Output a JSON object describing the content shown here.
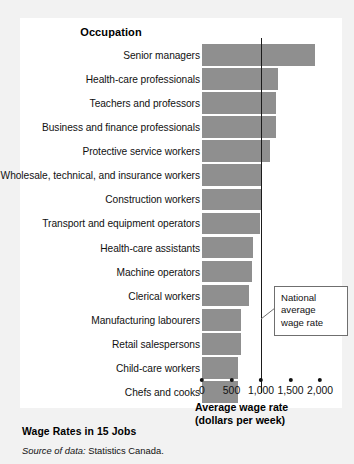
{
  "figure": {
    "column_heading": "Occupation",
    "title": "Wage Rates in 15 Jobs",
    "source_label": "Source of data:",
    "source_value": "Statistics Canada.",
    "callout": "National average wage rate",
    "bar_color": "#8f8f8f",
    "line_color": "#1b1b1b",
    "panel_color": "#ffffff",
    "background_color": "#f2f2f2"
  },
  "chart_data": {
    "type": "bar",
    "orientation": "horizontal",
    "title": "Wage Rates in 15 Jobs",
    "xlabel": "Average wage rate (dollars per week)",
    "ylabel": "Occupation",
    "xlim": [
      0,
      2000
    ],
    "xticks": [
      0,
      500,
      1000,
      1500,
      2000
    ],
    "xtick_labels": [
      "0",
      "500",
      "1,000",
      "1,500",
      "2,000"
    ],
    "grid": false,
    "legend": null,
    "annotations": [
      {
        "text": "National average wage rate",
        "type": "reference-line",
        "value": 1000
      }
    ],
    "categories": [
      "Senior managers",
      "Health-care professionals",
      "Teachers and professors",
      "Business and finance professionals",
      "Protective service workers",
      "Wholesale, technical, and insurance workers",
      "Construction workers",
      "Transport and equipment operators",
      "Health-care assistants",
      "Machine operators",
      "Clerical workers",
      "Manufacturing labourers",
      "Retail salespersons",
      "Child-care workers",
      "Chefs and cooks"
    ],
    "values": [
      1920,
      1280,
      1250,
      1250,
      1150,
      1010,
      1000,
      990,
      870,
      850,
      800,
      660,
      660,
      610,
      610
    ]
  },
  "axis": {
    "title_line1": "Average wage rate",
    "title_line2": "(dollars per week)"
  }
}
